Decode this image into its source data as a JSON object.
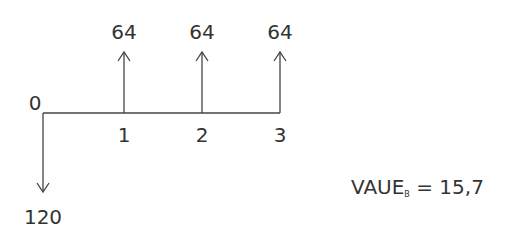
{
  "diagram": {
    "type": "cash-flow-timeline",
    "time_labels": [
      "0",
      "1",
      "2",
      "3"
    ],
    "inflows": [
      {
        "period": "1",
        "amount": "64"
      },
      {
        "period": "2",
        "amount": "64"
      },
      {
        "period": "3",
        "amount": "64"
      }
    ],
    "outflows": [
      {
        "period": "0",
        "amount": "120"
      }
    ],
    "result": {
      "name": "VAUE",
      "subscript": "B",
      "equals": "=",
      "value": "15,7"
    }
  }
}
